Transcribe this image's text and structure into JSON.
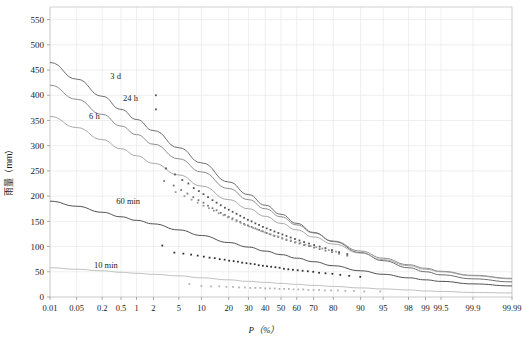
{
  "chart_data": {
    "type": "scatter",
    "title": "",
    "subtitle": "",
    "xlabel": "P（%）",
    "ylabel": "雨量（mm）",
    "xscale": "normal-probability",
    "grid": true,
    "legend_position": "inline-labels",
    "ylim": [
      0,
      575
    ],
    "yticks": [
      0,
      50,
      100,
      150,
      200,
      250,
      300,
      350,
      400,
      450,
      500,
      550
    ],
    "xticks": [
      "0.01",
      "0.05",
      "0.2",
      "0.5",
      "1",
      "2",
      "5",
      "10",
      "20",
      "30",
      "40",
      "50",
      "60",
      "70",
      "80",
      "90",
      "95",
      "98",
      "99",
      "99.5",
      "99.9",
      "99.99"
    ],
    "xtick_values": [
      0.01,
      0.05,
      0.2,
      0.5,
      1,
      2,
      5,
      10,
      20,
      30,
      40,
      50,
      60,
      70,
      80,
      90,
      95,
      98,
      99,
      99.5,
      99.9,
      99.99
    ],
    "annotations": [
      {
        "text": "3 d",
        "x_pct": 0.3,
        "y": 432,
        "color": "#333333"
      },
      {
        "text": "24 h",
        "x_pct": 0.55,
        "y": 388,
        "color": "#333333"
      },
      {
        "text": "6 h",
        "x_pct": 0.1,
        "y": 352,
        "color": "#333333"
      },
      {
        "text": "60 min",
        "x_pct": 0.4,
        "y": 184,
        "color": "#333333"
      },
      {
        "text": "10 min",
        "x_pct": 0.13,
        "y": 58,
        "color": "#333333"
      }
    ],
    "series": [
      {
        "name": "3 d",
        "color": "#555555",
        "curve": [
          [
            0.01,
            465
          ],
          [
            0.05,
            432
          ],
          [
            0.2,
            398
          ],
          [
            0.5,
            372
          ],
          [
            1,
            352
          ],
          [
            2,
            330
          ],
          [
            5,
            296
          ],
          [
            10,
            266
          ],
          [
            20,
            228
          ],
          [
            30,
            203
          ],
          [
            40,
            182
          ],
          [
            50,
            164
          ],
          [
            60,
            146
          ],
          [
            70,
            128
          ],
          [
            80,
            110
          ],
          [
            90,
            88
          ],
          [
            95,
            72
          ],
          [
            98,
            58
          ],
          [
            99,
            50
          ],
          [
            99.5,
            44
          ],
          [
            99.9,
            36
          ],
          [
            99.99,
            30
          ]
        ],
        "points": [
          [
            2.2,
            400
          ],
          [
            2.2,
            372
          ],
          [
            3.2,
            255
          ],
          [
            4.4,
            243
          ],
          [
            5.6,
            232
          ],
          [
            6.8,
            225
          ],
          [
            8.0,
            216
          ],
          [
            9.3,
            210
          ],
          [
            10.6,
            204
          ],
          [
            12.0,
            198
          ],
          [
            13.5,
            192
          ],
          [
            15.0,
            187
          ],
          [
            16.6,
            182
          ],
          [
            18.3,
            177
          ],
          [
            20.0,
            173
          ],
          [
            21.8,
            169
          ],
          [
            23.7,
            165
          ],
          [
            25.6,
            161
          ],
          [
            27.6,
            157
          ],
          [
            29.7,
            153
          ],
          [
            31.8,
            150
          ],
          [
            34.0,
            146
          ],
          [
            36.2,
            143
          ],
          [
            38.5,
            139
          ],
          [
            40.9,
            136
          ],
          [
            43.3,
            133
          ],
          [
            45.8,
            130
          ],
          [
            48.3,
            127
          ],
          [
            50.9,
            124
          ],
          [
            53.5,
            121
          ],
          [
            56.2,
            118
          ],
          [
            58.9,
            115
          ],
          [
            61.7,
            112
          ],
          [
            64.5,
            109
          ],
          [
            67.4,
            106
          ],
          [
            70.3,
            103
          ],
          [
            73.3,
            100
          ],
          [
            76.3,
            97
          ],
          [
            79.4,
            93
          ],
          [
            82.5,
            89
          ],
          [
            85.7,
            85
          ]
        ]
      },
      {
        "name": "24 h",
        "color": "#7a7a7a",
        "curve": [
          [
            0.01,
            420
          ],
          [
            0.05,
            392
          ],
          [
            0.2,
            362
          ],
          [
            0.5,
            339
          ],
          [
            1,
            322
          ],
          [
            2,
            303
          ],
          [
            5,
            274
          ],
          [
            10,
            248
          ],
          [
            20,
            215
          ],
          [
            30,
            193
          ],
          [
            40,
            175
          ],
          [
            50,
            159
          ],
          [
            60,
            143
          ],
          [
            70,
            127
          ],
          [
            80,
            111
          ],
          [
            90,
            91
          ],
          [
            95,
            77
          ],
          [
            98,
            64
          ],
          [
            99,
            57
          ],
          [
            99.5,
            51
          ],
          [
            99.9,
            43
          ],
          [
            99.99,
            37
          ]
        ],
        "points": [
          [
            3.0,
            230
          ],
          [
            4.2,
            221
          ],
          [
            5.4,
            212
          ],
          [
            6.6,
            205
          ],
          [
            7.9,
            198
          ],
          [
            9.2,
            192
          ],
          [
            10.6,
            187
          ],
          [
            12.0,
            181
          ],
          [
            13.5,
            176
          ],
          [
            15.0,
            172
          ],
          [
            16.6,
            167
          ],
          [
            18.3,
            163
          ],
          [
            20.0,
            159
          ],
          [
            21.8,
            156
          ],
          [
            23.7,
            152
          ],
          [
            25.6,
            149
          ],
          [
            27.6,
            145
          ],
          [
            29.7,
            142
          ],
          [
            31.8,
            139
          ],
          [
            34.0,
            136
          ],
          [
            36.2,
            133
          ],
          [
            38.5,
            130
          ],
          [
            40.9,
            127
          ],
          [
            43.3,
            124
          ],
          [
            45.8,
            121
          ],
          [
            48.3,
            119
          ],
          [
            50.9,
            116
          ],
          [
            53.5,
            113
          ],
          [
            56.2,
            111
          ],
          [
            58.9,
            108
          ],
          [
            61.7,
            106
          ],
          [
            64.5,
            103
          ],
          [
            67.4,
            101
          ],
          [
            70.3,
            98
          ],
          [
            73.3,
            95
          ],
          [
            76.3,
            92
          ],
          [
            79.4,
            89
          ],
          [
            82.5,
            86
          ],
          [
            85.7,
            82
          ]
        ]
      },
      {
        "name": "6 h",
        "color": "#9a9a9a",
        "curve": [
          [
            0.01,
            358
          ],
          [
            0.05,
            336
          ],
          [
            0.2,
            312
          ],
          [
            0.5,
            294
          ],
          [
            1,
            280
          ],
          [
            2,
            265
          ],
          [
            5,
            242
          ],
          [
            10,
            220
          ],
          [
            20,
            193
          ],
          [
            30,
            175
          ],
          [
            40,
            160
          ],
          [
            50,
            146
          ],
          [
            60,
            133
          ],
          [
            70,
            119
          ],
          [
            80,
            105
          ],
          [
            90,
            87
          ],
          [
            95,
            74
          ],
          [
            98,
            62
          ],
          [
            99,
            55
          ],
          [
            99.5,
            50
          ],
          [
            99.9,
            42
          ],
          [
            99.99,
            36
          ]
        ],
        "points": [
          [
            4.5,
            208
          ],
          [
            6.0,
            200
          ],
          [
            7.5,
            193
          ],
          [
            9.0,
            187
          ],
          [
            10.6,
            181
          ],
          [
            12.3,
            176
          ],
          [
            14.0,
            171
          ],
          [
            15.8,
            166
          ],
          [
            17.7,
            162
          ],
          [
            19.6,
            158
          ],
          [
            21.6,
            154
          ],
          [
            23.7,
            150
          ],
          [
            25.8,
            147
          ],
          [
            28.0,
            143
          ],
          [
            30.3,
            140
          ],
          [
            32.6,
            137
          ],
          [
            35.0,
            134
          ],
          [
            37.5,
            131
          ],
          [
            40.0,
            128
          ],
          [
            42.6,
            125
          ],
          [
            45.2,
            122
          ],
          [
            47.9,
            120
          ],
          [
            50.7,
            117
          ],
          [
            53.5,
            114
          ],
          [
            56.4,
            112
          ],
          [
            59.3,
            109
          ],
          [
            62.3,
            107
          ],
          [
            65.3,
            104
          ],
          [
            68.4,
            101
          ],
          [
            71.5,
            99
          ],
          [
            74.7,
            96
          ],
          [
            77.9,
            93
          ],
          [
            81.2,
            90
          ]
        ]
      },
      {
        "name": "60 min",
        "color": "#333333",
        "curve": [
          [
            0.01,
            190
          ],
          [
            0.05,
            180
          ],
          [
            0.2,
            168
          ],
          [
            0.5,
            159
          ],
          [
            1,
            152
          ],
          [
            2,
            145
          ],
          [
            5,
            133
          ],
          [
            10,
            122
          ],
          [
            20,
            108
          ],
          [
            30,
            99
          ],
          [
            40,
            91
          ],
          [
            50,
            84
          ],
          [
            60,
            77
          ],
          [
            70,
            70
          ],
          [
            80,
            62
          ],
          [
            90,
            52
          ],
          [
            95,
            45
          ],
          [
            98,
            38
          ],
          [
            99,
            34
          ],
          [
            99.5,
            31
          ],
          [
            99.9,
            26
          ],
          [
            99.99,
            22
          ]
        ],
        "points": [
          [
            2.8,
            102
          ],
          [
            4.3,
            88
          ],
          [
            5.8,
            86
          ],
          [
            7.4,
            84
          ],
          [
            9.0,
            82
          ],
          [
            10.7,
            80
          ],
          [
            12.5,
            78
          ],
          [
            14.3,
            77
          ],
          [
            16.2,
            75
          ],
          [
            18.2,
            74
          ],
          [
            20.2,
            72
          ],
          [
            22.3,
            71
          ],
          [
            24.4,
            70
          ],
          [
            26.6,
            68
          ],
          [
            28.9,
            67
          ],
          [
            31.2,
            66
          ],
          [
            33.6,
            65
          ],
          [
            36.0,
            63
          ],
          [
            38.5,
            62
          ],
          [
            41.1,
            61
          ],
          [
            43.7,
            60
          ],
          [
            46.4,
            59
          ],
          [
            49.1,
            58
          ],
          [
            51.9,
            56
          ],
          [
            54.7,
            55
          ],
          [
            57.6,
            54
          ],
          [
            60.6,
            53
          ],
          [
            63.6,
            52
          ],
          [
            66.7,
            51
          ],
          [
            69.8,
            50
          ],
          [
            73.0,
            48
          ],
          [
            76.3,
            47
          ],
          [
            79.6,
            46
          ],
          [
            83.0,
            44
          ],
          [
            86.4,
            42
          ],
          [
            89.9,
            40
          ]
        ]
      },
      {
        "name": "10 min",
        "color": "#b4b4b4",
        "curve": [
          [
            0.01,
            58
          ],
          [
            0.05,
            55
          ],
          [
            0.2,
            52
          ],
          [
            0.5,
            49
          ],
          [
            1,
            47
          ],
          [
            2,
            45
          ],
          [
            5,
            42
          ],
          [
            10,
            38
          ],
          [
            20,
            34
          ],
          [
            30,
            31
          ],
          [
            40,
            29
          ],
          [
            50,
            27
          ],
          [
            60,
            25
          ],
          [
            70,
            23
          ],
          [
            80,
            21
          ],
          [
            90,
            18
          ],
          [
            95,
            16
          ],
          [
            98,
            14
          ],
          [
            99,
            12
          ],
          [
            99.5,
            11
          ],
          [
            99.9,
            9
          ],
          [
            99.99,
            8
          ]
        ],
        "points": [
          [
            7.0,
            26
          ],
          [
            10.0,
            22
          ],
          [
            13.0,
            21
          ],
          [
            16.0,
            21
          ],
          [
            19.0,
            20
          ],
          [
            22.0,
            20
          ],
          [
            25.0,
            19
          ],
          [
            28.0,
            19
          ],
          [
            31.0,
            18
          ],
          [
            34.0,
            18
          ],
          [
            37.0,
            18
          ],
          [
            40.0,
            17
          ],
          [
            43.0,
            17
          ],
          [
            46.0,
            17
          ],
          [
            49.0,
            16
          ],
          [
            52.0,
            16
          ],
          [
            55.0,
            16
          ],
          [
            58.0,
            15
          ],
          [
            61.0,
            15
          ],
          [
            64.0,
            15
          ],
          [
            67.0,
            14
          ],
          [
            70.0,
            14
          ],
          [
            73.0,
            14
          ],
          [
            76.0,
            13
          ],
          [
            79.0,
            13
          ],
          [
            82.0,
            13
          ],
          [
            85.0,
            12
          ],
          [
            88.0,
            12
          ],
          [
            91.0,
            11
          ],
          [
            94.5,
            11
          ]
        ]
      }
    ]
  },
  "figure": {
    "frame_color": "#cccccc",
    "grid_color": "#e8e8e8",
    "background": "#ffffff"
  }
}
